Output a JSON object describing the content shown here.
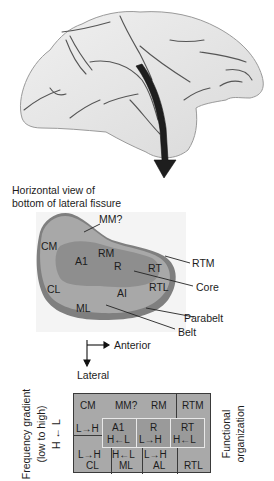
{
  "figure": {
    "brain_view": "lateral view of macaque brain",
    "caption": {
      "line1": "Horizontal view of",
      "line2": "bottom of lateral fissure"
    },
    "regions_map": {
      "labels": {
        "mm": "MM?",
        "cm": "CM",
        "a1": "A1",
        "rm": "RM",
        "r": "R",
        "rt": "RT",
        "rtm": "RTM",
        "cl": "CL",
        "al": "AI",
        "rtl": "RTL",
        "ml": "ML"
      },
      "callouts": {
        "core": "Core",
        "parabelt": "Parabelt",
        "belt": "Belt"
      },
      "colors": {
        "parabelt": "#7f7f7f",
        "belt": "#a8a8a8",
        "core": "#8e8e8e"
      }
    },
    "orientation": {
      "anterior": "Anterior",
      "lateral": "Lateral"
    },
    "functional_table": {
      "left_axis": {
        "line1": "Frequency gradient",
        "line2": "(low to high)",
        "arrow": "H ← L"
      },
      "right_axis": {
        "line1": "Functional",
        "line2": "organization"
      },
      "top_row": {
        "cm": "CM",
        "mm": "MM?",
        "rm": "RM",
        "rtm": "RTM"
      },
      "middle_row": {
        "cm_gradient": "L→H",
        "a1": "A1",
        "a1_gradient": "H←L",
        "r": "R",
        "r_gradient": "L→H",
        "rt": "RT",
        "rt_gradient": "H←L"
      },
      "bottom_row": {
        "cl_gradient": "L→H",
        "cl": "CL",
        "ml_gradient": "H←L",
        "ml": "ML",
        "al_gradient": "L→H",
        "al": "AL",
        "rtl": "RTL"
      }
    }
  }
}
